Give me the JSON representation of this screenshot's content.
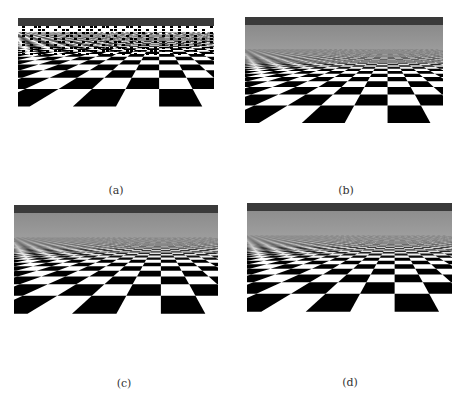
{
  "figure": {
    "panels": [
      {
        "id": "a",
        "label": "(a)",
        "description": "checkerboard plane, no filtering (point sampling, severe aliasing)",
        "horizon_color": "#3a3a3a",
        "far_fill": "aliased"
      },
      {
        "id": "b",
        "label": "(b)",
        "description": "checkerboard plane, filtered (blurred to gray at distance)",
        "horizon_color": "#3a3a3a",
        "far_fill": "#8a8a8a"
      },
      {
        "id": "c",
        "label": "(c)",
        "description": "checkerboard plane, filtered variant",
        "horizon_color": "#3a3a3a",
        "far_fill": "#8c8c8c"
      },
      {
        "id": "d",
        "label": "(d)",
        "description": "checkerboard plane, anisotropic-like filtering (sharp converging lines)",
        "horizon_color": "#3a3a3a",
        "far_fill": "#8e8e8e"
      }
    ]
  }
}
